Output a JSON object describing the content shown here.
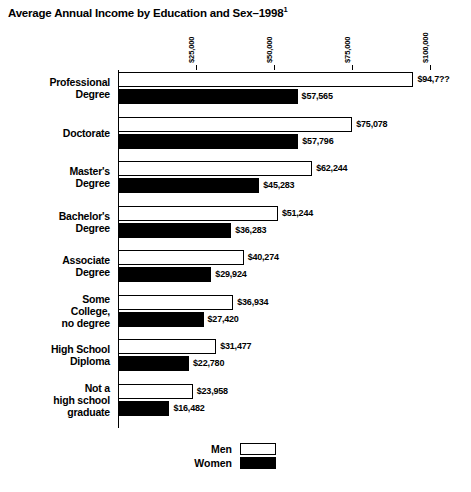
{
  "chart_data": {
    "type": "bar",
    "orientation": "horizontal",
    "title": "Average Annual Income by Education and Sex–1998",
    "title_footnote": "1",
    "xlabel": "",
    "ylabel": "",
    "xlim": [
      0,
      100000
    ],
    "grid": false,
    "legend_position": "bottom",
    "tick_labels": [
      "$25,000",
      "$50,000",
      "$75,000",
      "$100,000"
    ],
    "tick_values": [
      25000,
      50000,
      75000,
      100000
    ],
    "categories": [
      "Professional\nDegree",
      "Doctorate",
      "Master's\nDegree",
      "Bachelor's\nDegree",
      "Associate\nDegree",
      "Some\nCollege,\nno degree",
      "High School\nDiploma",
      "Not a\nhigh school\ngraduate"
    ],
    "category_lines": [
      [
        "Professional",
        "Degree"
      ],
      [
        "Doctorate"
      ],
      [
        "Master's",
        "Degree"
      ],
      [
        "Bachelor's",
        "Degree"
      ],
      [
        "Associate",
        "Degree"
      ],
      [
        "Some",
        "College,",
        "no degree"
      ],
      [
        "High School",
        "Diploma"
      ],
      [
        "Not a",
        "high school",
        "graduate"
      ]
    ],
    "series": [
      {
        "name": "Men",
        "color": "#ffffff",
        "values": [
          94700,
          75078,
          62244,
          51244,
          40274,
          36934,
          31477,
          23958
        ],
        "labels": [
          "$94,7??",
          "$75,078",
          "$62,244",
          "$51,244",
          "$40,274",
          "$36,934",
          "$31,477",
          "$23,958"
        ]
      },
      {
        "name": "Women",
        "color": "#000000",
        "values": [
          57565,
          57796,
          45283,
          36283,
          29924,
          27420,
          22780,
          16482
        ],
        "labels": [
          "$57,565",
          "$57,796",
          "$45,283",
          "$36,283",
          "$29,924",
          "$27,420",
          "$22,780",
          "$16,482"
        ]
      }
    ],
    "legend": [
      {
        "label": "Men",
        "color": "#ffffff"
      },
      {
        "label": "Women",
        "color": "#000000"
      }
    ]
  }
}
